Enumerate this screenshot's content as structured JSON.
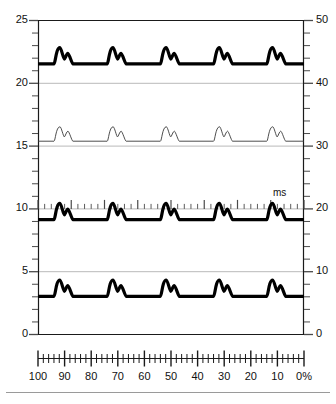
{
  "chart_data": {
    "type": "line",
    "title": "",
    "subtitle": "",
    "xlabel": "",
    "ylabel": "",
    "grid": true,
    "legend_position": "none",
    "left_axis": {
      "label": "",
      "range": [
        0,
        25
      ],
      "tick_step": 1,
      "labeled_ticks": [
        25,
        20,
        15,
        10,
        5,
        0
      ],
      "tick_labels": [
        "25",
        "20",
        "15",
        "10",
        "5",
        "0"
      ]
    },
    "right_axis": {
      "label": "",
      "range": [
        0,
        50
      ],
      "tick_step": 2,
      "labeled_ticks": [
        50,
        40,
        30,
        20,
        10,
        0
      ],
      "tick_labels": [
        "50",
        "40",
        "30",
        "20",
        "10",
        "0"
      ]
    },
    "inner_time_axis": {
      "unit_label": "ms",
      "at_left_value": 10,
      "at_right_value": 20,
      "minor_ticks": 40,
      "major_every": 5
    },
    "bottom_scale": {
      "unit_label": "%",
      "direction": "descending",
      "range": [
        100,
        0
      ],
      "tick_labels": [
        "100",
        "90",
        "80",
        "70",
        "60",
        "50",
        "40",
        "30",
        "20",
        "10",
        "0%"
      ],
      "tick_values": [
        100,
        90,
        80,
        70,
        60,
        50,
        40,
        30,
        20,
        10,
        0
      ],
      "minor_tick_step": 2,
      "major_tick_step": 10
    },
    "series": [
      {
        "name": "trace-1",
        "stroke": "#000000",
        "stroke_width": 3.2,
        "baseline_left_value": 21.5,
        "peak1_height": 1.3,
        "peak2_height": 0.85,
        "pulse_count": 5,
        "pulse_starts_pct": [
          94,
          74,
          54,
          34,
          14
        ]
      },
      {
        "name": "trace-2",
        "stroke": "#3a3a3a",
        "stroke_width": 0.9,
        "baseline_left_value": 15.35,
        "peak1_height": 1.15,
        "peak2_height": 0.8,
        "pulse_count": 5,
        "pulse_starts_pct": [
          94,
          74,
          54,
          34,
          14
        ]
      },
      {
        "name": "trace-3",
        "stroke": "#000000",
        "stroke_width": 3.2,
        "baseline_left_value": 9.1,
        "peak1_height": 1.3,
        "peak2_height": 0.85,
        "pulse_count": 5,
        "pulse_starts_pct": [
          94,
          74,
          54,
          34,
          14
        ]
      },
      {
        "name": "trace-4",
        "stroke": "#000000",
        "stroke_width": 3.2,
        "baseline_left_value": 3.0,
        "peak1_height": 1.3,
        "peak2_height": 0.85,
        "pulse_count": 5,
        "pulse_starts_pct": [
          94,
          74,
          54,
          34,
          14
        ]
      }
    ],
    "colors": {
      "frame": "#1a1a1a",
      "gridline": "#b9b9b9",
      "tick": "#4a4a4a",
      "text": "#111111",
      "trace_bold": "#000000",
      "trace_thin": "#3a3a3a"
    }
  },
  "left_labels": [
    {
      "text": "25",
      "value": 25
    },
    {
      "text": "20",
      "value": 20
    },
    {
      "text": "15",
      "value": 15
    },
    {
      "text": "10",
      "value": 10
    },
    {
      "text": "5",
      "value": 5
    },
    {
      "text": "0",
      "value": 0
    }
  ],
  "right_labels": [
    {
      "text": "50",
      "value": 25
    },
    {
      "text": "40",
      "value": 20
    },
    {
      "text": "30",
      "value": 15
    },
    {
      "text": "20",
      "value": 10
    },
    {
      "text": "10",
      "value": 5
    },
    {
      "text": "0",
      "value": 0
    }
  ],
  "bottom_labels": [
    {
      "text": "100",
      "value": 100
    },
    {
      "text": "90",
      "value": 90
    },
    {
      "text": "80",
      "value": 80
    },
    {
      "text": "70",
      "value": 70
    },
    {
      "text": "60",
      "value": 60
    },
    {
      "text": "50",
      "value": 50
    },
    {
      "text": "40",
      "value": 40
    },
    {
      "text": "30",
      "value": 30
    },
    {
      "text": "20",
      "value": 20
    },
    {
      "text": "10",
      "value": 10
    },
    {
      "text": "0%",
      "value": 0
    }
  ],
  "ms_label": "ms"
}
